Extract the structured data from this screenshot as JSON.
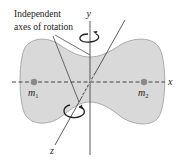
{
  "figure": {
    "annotation": {
      "line1": "Independent",
      "line2": "axes of rotation"
    },
    "axes": {
      "x": "x",
      "y": "y",
      "z": "z"
    },
    "masses": [
      {
        "symbol": "m",
        "subscript": "1"
      },
      {
        "symbol": "m",
        "subscript": "2"
      }
    ],
    "colors": {
      "body_fill": "#d9d9d9",
      "body_stroke": "#9a9a9a",
      "axis_line": "#333333",
      "mass_dot": "#8a8a8a",
      "background": "#ffffff"
    },
    "icons": [
      "rotation-arrow-y-icon",
      "rotation-arrow-z-icon"
    ]
  }
}
